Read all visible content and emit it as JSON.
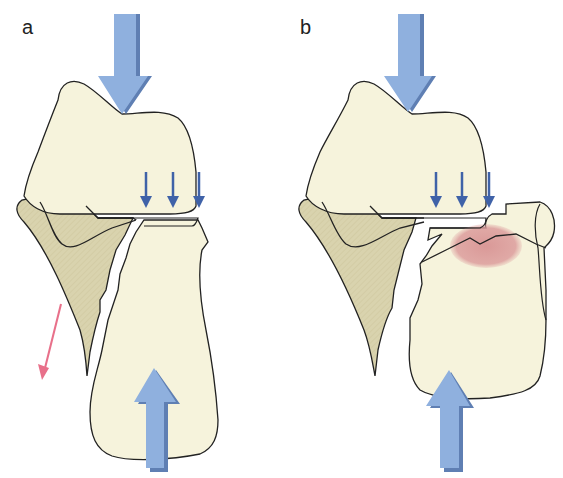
{
  "figure": {
    "panels": [
      {
        "id": "a",
        "label": "a",
        "description": "Axial compression with lateral fibula-side fragment displacing away (split fracture)"
      },
      {
        "id": "b",
        "label": "b",
        "description": "Axial compression with depressed articular surface and subchondral contusion (red zone)"
      }
    ],
    "colors": {
      "bone_fill": "#f6f3dc",
      "fibula_fill": "#d9d3ae",
      "outline": "#222222",
      "large_arrow": "#8fb0de",
      "large_arrow_shadow": "#5f7fb3",
      "small_arrow": "#3f62a8",
      "displacement_arrow": "#e8708a",
      "contusion": "#d99a9a"
    },
    "legend": {
      "large_arrows": "axial load",
      "small_arrows": "joint surface compression",
      "pink_arrow": "fragment displacement",
      "red_zone": "bone contusion"
    }
  }
}
